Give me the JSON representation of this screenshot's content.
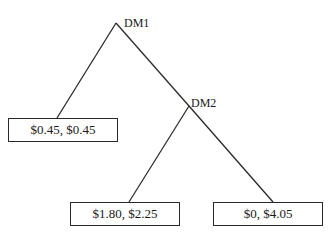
{
  "diagram": {
    "type": "game-tree",
    "line_color": "#2a2a2a",
    "nodes": {
      "dm1": {
        "label": "DM1"
      },
      "dm2": {
        "label": "DM2"
      }
    },
    "payoffs": {
      "left": {
        "label": "$0.45, $0.45"
      },
      "bottom_left": {
        "label": "$1.80, $2.25"
      },
      "bottom_right": {
        "label": "$0, $4.05"
      }
    },
    "edges": [
      {
        "from": "DM1",
        "to": "$0.45, $0.45"
      },
      {
        "from": "DM1",
        "to": "DM2"
      },
      {
        "from": "DM2",
        "to": "$1.80, $2.25"
      },
      {
        "from": "DM2",
        "to": "$0, $4.05"
      }
    ]
  }
}
